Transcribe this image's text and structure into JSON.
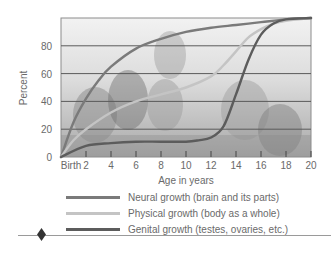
{
  "chart_data": {
    "type": "line",
    "title": "",
    "xlabel": "Age in years",
    "ylabel": "Percent",
    "x_ticks": [
      "Birth",
      "2",
      "4",
      "6",
      "8",
      "10",
      "12",
      "14",
      "16",
      "18",
      "20"
    ],
    "y_ticks": [
      "0",
      "20",
      "40",
      "60",
      "80"
    ],
    "xlim": [
      0,
      20
    ],
    "ylim": [
      0,
      100
    ],
    "grid": "horizontal lines at 20, 40, 60, 80",
    "background": "grayscale photo of teenagers behind plot",
    "legend_position": "below chart",
    "series": [
      {
        "name": "Neural growth (brain and its parts)",
        "color": "#7a7a7a",
        "x": [
          0,
          1,
          2,
          3,
          4,
          6,
          8,
          10,
          12,
          14,
          16,
          18,
          20
        ],
        "values": [
          0,
          25,
          42,
          55,
          65,
          78,
          85,
          90,
          93,
          95,
          97,
          99,
          100
        ]
      },
      {
        "name": "Physical growth (body as a whole)",
        "color": "#c4c4c4",
        "x": [
          0,
          1,
          2,
          4,
          6,
          8,
          10,
          12,
          13,
          14,
          15,
          16,
          17,
          18,
          20
        ],
        "values": [
          0,
          12,
          20,
          32,
          40,
          45,
          50,
          58,
          66,
          76,
          86,
          92,
          96,
          98,
          100
        ]
      },
      {
        "name": "Genital growth (testes, ovaries, etc.)",
        "color": "#5c5c5c",
        "x": [
          0,
          2,
          4,
          6,
          8,
          10,
          11,
          12,
          13,
          14,
          15,
          16,
          17,
          18,
          20
        ],
        "values": [
          0,
          8,
          10,
          11,
          11,
          11,
          12,
          14,
          22,
          45,
          70,
          88,
          96,
          99,
          100
        ]
      }
    ]
  },
  "legend": {
    "items": [
      {
        "label": "Neural growth (brain and its parts)",
        "color": "#7a7a7a"
      },
      {
        "label": "Physical growth (body as a whole)",
        "color": "#c4c4c4"
      },
      {
        "label": "Genital growth (testes, ovaries, etc.)",
        "color": "#5c5c5c"
      }
    ]
  }
}
